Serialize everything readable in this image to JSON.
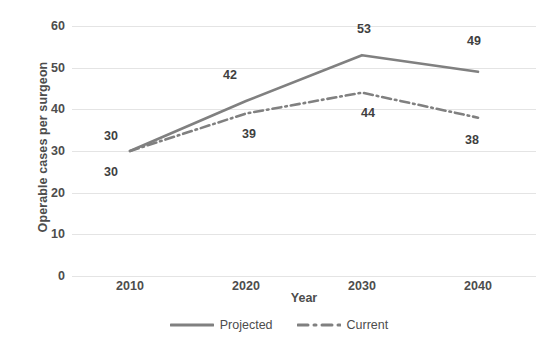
{
  "chart_data": {
    "type": "line",
    "title": "",
    "xlabel": "Year",
    "ylabel": "Operable cases per surgeon",
    "categories": [
      "2010",
      "2020",
      "2030",
      "2040"
    ],
    "x": [
      2010,
      2020,
      2030,
      2040
    ],
    "ylim": [
      0,
      60
    ],
    "yticks": [
      0,
      10,
      20,
      30,
      40,
      50,
      60
    ],
    "ytick_labels": [
      "0",
      "10",
      "20",
      "30",
      "40",
      "50",
      "60"
    ],
    "grid": true,
    "legend_position": "bottom-center",
    "series": [
      {
        "name": "Projected",
        "values": [
          30,
          42,
          53,
          49
        ],
        "line_style": "solid",
        "color": "#808080",
        "data_labels": [
          "30",
          "42",
          "53",
          "49"
        ]
      },
      {
        "name": "Current",
        "values": [
          30,
          39,
          44,
          38
        ],
        "line_style": "dash-dot",
        "color": "#808080",
        "data_labels": [
          "30",
          "39",
          "44",
          "38"
        ]
      }
    ]
  },
  "colors": {
    "line": "#808080",
    "gridline": "#e4e4e4",
    "axis_text": "#4d4d4d",
    "data_label_text": "#3f3f3f",
    "background": "#ffffff"
  },
  "legend": {
    "items": [
      {
        "label": "Projected",
        "style": "solid",
        "color": "#808080"
      },
      {
        "label": "Current",
        "style": "dash-dot",
        "color": "#808080"
      }
    ]
  }
}
